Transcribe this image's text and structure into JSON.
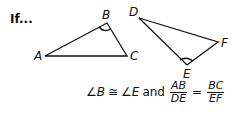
{
  "intro": "If...",
  "triangle1": {
    "A": "A",
    "B": "B",
    "C": "C"
  },
  "triangle2": {
    "D": "D",
    "E": "E",
    "F": "F"
  },
  "formula": {
    "angle1": "∠B",
    "congruent": "≅",
    "angle2": "∠E",
    "and": "and",
    "frac1": {
      "num": "AB",
      "den": "DE"
    },
    "equals": "=",
    "frac2": {
      "num": "BC",
      "den": "EF"
    }
  }
}
